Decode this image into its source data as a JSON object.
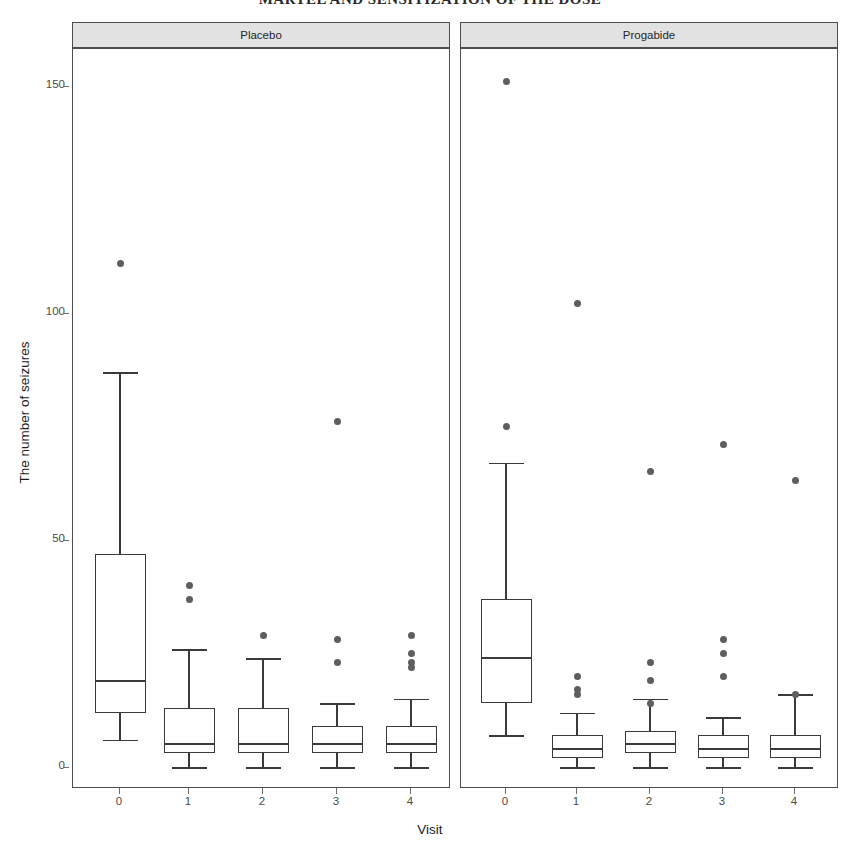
{
  "page_header": "MARTEL AND SENSITIZATION OF THE DOSE",
  "chart_data": {
    "type": "box",
    "title": "",
    "xlabel": "Visit",
    "ylabel": "The number of seizures",
    "ylim": [
      -7,
      158
    ],
    "yticks": [
      0,
      50,
      100,
      150
    ],
    "ytick_labels": [
      "0",
      "50",
      "100",
      "150"
    ],
    "xticks": [
      0,
      1,
      2,
      3,
      4
    ],
    "xtick_labels": [
      "0",
      "1",
      "2",
      "3",
      "4"
    ],
    "grid": false,
    "legend": null,
    "facet_labels": [
      "Placebo",
      "Progabide"
    ],
    "panels": [
      {
        "label": "Placebo",
        "boxes": [
          {
            "x": 0,
            "lower_whisker": 6,
            "q1": 12,
            "median": 19,
            "q3": 47,
            "upper_whisker": 87,
            "outliers": [
              111
            ]
          },
          {
            "x": 1,
            "lower_whisker": 0,
            "q1": 3,
            "median": 5,
            "q3": 13,
            "upper_whisker": 26,
            "outliers": [
              40,
              37
            ]
          },
          {
            "x": 2,
            "lower_whisker": 0,
            "q1": 3,
            "median": 5,
            "q3": 13,
            "upper_whisker": 24,
            "outliers": [
              29
            ]
          },
          {
            "x": 3,
            "lower_whisker": 0,
            "q1": 3,
            "median": 5,
            "q3": 9,
            "upper_whisker": 14,
            "outliers": [
              76,
              28,
              23
            ]
          },
          {
            "x": 4,
            "lower_whisker": 0,
            "q1": 3,
            "median": 5,
            "q3": 9,
            "upper_whisker": 15,
            "outliers": [
              29,
              25,
              23,
              22
            ]
          }
        ]
      },
      {
        "label": "Progabide",
        "boxes": [
          {
            "x": 0,
            "lower_whisker": 7,
            "q1": 14,
            "median": 24,
            "q3": 37,
            "upper_whisker": 67,
            "outliers": [
              151,
              75
            ]
          },
          {
            "x": 1,
            "lower_whisker": 0,
            "q1": 2,
            "median": 4,
            "q3": 7,
            "upper_whisker": 12,
            "outliers": [
              102,
              20,
              17,
              16
            ]
          },
          {
            "x": 2,
            "lower_whisker": 0,
            "q1": 3,
            "median": 5,
            "q3": 8,
            "upper_whisker": 15,
            "outliers": [
              65,
              23,
              19,
              14
            ]
          },
          {
            "x": 3,
            "lower_whisker": 0,
            "q1": 2,
            "median": 4,
            "q3": 7,
            "upper_whisker": 11,
            "outliers": [
              71,
              28,
              25,
              20
            ]
          },
          {
            "x": 4,
            "lower_whisker": 0,
            "q1": 2,
            "median": 4,
            "q3": 7,
            "upper_whisker": 16,
            "outliers": [
              63,
              16
            ]
          }
        ]
      }
    ]
  },
  "geometry": {
    "y0_px": 767,
    "y150_px": 86,
    "panels": [
      {
        "left": 72,
        "right": 450,
        "ticks": [
          119,
          188,
          262,
          336,
          410
        ]
      },
      {
        "left": 460,
        "right": 838,
        "ticks": [
          505,
          576,
          649,
          722,
          794
        ]
      }
    ],
    "box_width": 51,
    "cap_width": 35
  }
}
